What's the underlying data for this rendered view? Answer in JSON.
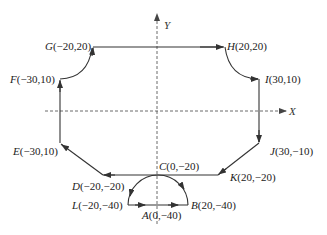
{
  "diagram": {
    "type": "toolpath",
    "axes": {
      "x_label": "X",
      "y_label": "Y"
    },
    "points": [
      {
        "id": "A",
        "label": "A(0,−40)",
        "letter": "A",
        "coords": "(0,−40)"
      },
      {
        "id": "B",
        "label": "B(20,−40)",
        "letter": "B",
        "coords": "(20,−40)"
      },
      {
        "id": "C",
        "label": "C(0,−20)",
        "letter": "C",
        "coords": "(0,−20)"
      },
      {
        "id": "D",
        "label": "D(−20,−20)",
        "letter": "D",
        "coords": "(−20,−20)"
      },
      {
        "id": "E",
        "label": "E(−30,10)",
        "letter": "E",
        "coords": "(−30,10)"
      },
      {
        "id": "F",
        "label": "F(−30,10)",
        "letter": "F",
        "coords": "(−30,10)"
      },
      {
        "id": "G",
        "label": "G(−20,20)",
        "letter": "G",
        "coords": "(−20,20)"
      },
      {
        "id": "H",
        "label": "H(20,20)",
        "letter": "H",
        "coords": "(20,20)"
      },
      {
        "id": "I",
        "label": "I(30,10)",
        "letter": "I",
        "coords": "(30,10)"
      },
      {
        "id": "J",
        "label": "J(30,−10)",
        "letter": "J",
        "coords": "(30,−10)"
      },
      {
        "id": "K",
        "label": "K(20,−20)",
        "letter": "K",
        "coords": "(20,−20)"
      },
      {
        "id": "L",
        "label": "L(−20,−40)",
        "letter": "L",
        "coords": "(−20,−40)"
      }
    ],
    "path_order": [
      "A",
      "B",
      "C",
      "K",
      "J",
      "I",
      "H",
      "G",
      "F",
      "E",
      "D",
      "C",
      "L",
      "A"
    ],
    "colors": {
      "line": "#333333",
      "axis": "#444444",
      "background": "#ffffff"
    }
  }
}
